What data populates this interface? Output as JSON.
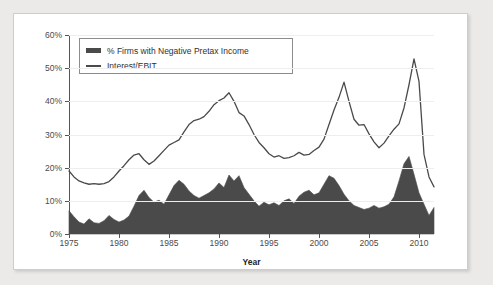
{
  "chart_data": {
    "type": "area",
    "title": "",
    "xlabel": "Year",
    "ylabel": "",
    "xlim": [
      1975,
      2011.5
    ],
    "ylim": [
      0,
      60
    ],
    "grid": true,
    "legend_position": "top-left-inside",
    "y_ticks": [
      "0%",
      "10%",
      "20%",
      "30%",
      "40%",
      "50%",
      "60%"
    ],
    "y_tick_values": [
      0,
      10,
      20,
      30,
      40,
      50,
      60
    ],
    "x_ticks": [
      "1975",
      "1980",
      "1985",
      "1990",
      "1995",
      "2000",
      "2005",
      "2010"
    ],
    "x_tick_values": [
      1975,
      1980,
      1985,
      1990,
      1995,
      2000,
      2005,
      2010
    ],
    "colors": {
      "area": "#4a4a4a",
      "line": "#4a4a4a",
      "grid": "#f0eeec",
      "axis": "#555555"
    },
    "series": [
      {
        "name": "% Firms with Negative Pretax Income",
        "type": "area",
        "x": [
          1975,
          1975.5,
          1976,
          1976.5,
          1977,
          1977.5,
          1978,
          1978.5,
          1979,
          1979.5,
          1980,
          1980.5,
          1981,
          1981.5,
          1982,
          1982.5,
          1983,
          1983.5,
          1984,
          1984.5,
          1985,
          1985.5,
          1986,
          1986.5,
          1987,
          1987.5,
          1988,
          1988.5,
          1989,
          1989.5,
          1990,
          1990.5,
          1991,
          1991.5,
          1992,
          1992.5,
          1993,
          1993.5,
          1994,
          1994.5,
          1995,
          1995.5,
          1996,
          1996.5,
          1997,
          1997.5,
          1998,
          1998.5,
          1999,
          1999.5,
          2000,
          2000.5,
          2001,
          2001.5,
          2002,
          2002.5,
          2003,
          2003.5,
          2004,
          2004.5,
          2005,
          2005.5,
          2006,
          2006.5,
          2007,
          2007.5,
          2008,
          2008.5,
          2009,
          2009.5,
          2010,
          2010.5,
          2011,
          2011.5
        ],
        "values": [
          7.0,
          5.2,
          3.6,
          3.0,
          4.6,
          3.4,
          3.2,
          4.0,
          5.6,
          4.4,
          3.6,
          4.2,
          5.4,
          8.4,
          11.6,
          13.2,
          11.0,
          9.6,
          10.2,
          9.0,
          11.8,
          14.6,
          16.2,
          15.0,
          13.0,
          11.6,
          10.8,
          11.6,
          12.4,
          13.6,
          15.4,
          14.0,
          17.8,
          16.0,
          17.6,
          14.0,
          12.0,
          10.0,
          8.4,
          9.6,
          8.8,
          9.4,
          8.6,
          10.0,
          10.6,
          9.2,
          11.4,
          12.6,
          13.2,
          11.8,
          12.4,
          15.0,
          17.6,
          16.8,
          14.6,
          12.0,
          10.0,
          8.6,
          8.0,
          7.4,
          7.8,
          8.6,
          7.8,
          8.2,
          9.0,
          11.2,
          16.0,
          21.2,
          23.4,
          18.0,
          12.4,
          9.0,
          5.6,
          8.0
        ]
      },
      {
        "name": "Interest/EBIT",
        "type": "line",
        "x": [
          1975,
          1975.5,
          1976,
          1976.5,
          1977,
          1977.5,
          1978,
          1978.5,
          1979,
          1979.5,
          1980,
          1980.5,
          1981,
          1981.5,
          1982,
          1982.5,
          1983,
          1983.5,
          1984,
          1984.5,
          1985,
          1985.5,
          1986,
          1986.5,
          1987,
          1987.5,
          1988,
          1988.5,
          1989,
          1989.5,
          1990,
          1990.5,
          1991,
          1991.5,
          1992,
          1992.5,
          1993,
          1993.5,
          1994,
          1994.5,
          1995,
          1995.5,
          1996,
          1996.5,
          1997,
          1997.5,
          1998,
          1998.5,
          1999,
          1999.5,
          2000,
          2000.5,
          2001,
          2001.5,
          2002,
          2002.5,
          2003,
          2003.5,
          2004,
          2004.5,
          2005,
          2005.5,
          2006,
          2006.5,
          2007,
          2007.5,
          2008,
          2008.5,
          2009,
          2009.5,
          2010,
          2010.5,
          2011,
          2011.5
        ],
        "values": [
          19.0,
          17.2,
          16.0,
          15.4,
          15.0,
          15.2,
          15.0,
          15.2,
          15.8,
          17.2,
          19.0,
          20.6,
          22.4,
          23.8,
          24.2,
          22.4,
          21.0,
          22.0,
          23.6,
          25.2,
          26.8,
          27.6,
          28.4,
          30.8,
          33.0,
          34.2,
          34.6,
          35.4,
          37.0,
          39.0,
          40.2,
          41.0,
          42.6,
          40.0,
          36.6,
          35.6,
          33.0,
          30.0,
          27.6,
          26.0,
          24.2,
          23.2,
          23.6,
          22.8,
          23.0,
          23.6,
          24.6,
          23.8,
          24.0,
          25.2,
          26.2,
          28.6,
          33.0,
          37.4,
          41.2,
          45.8,
          40.0,
          34.6,
          32.8,
          33.0,
          30.2,
          27.8,
          26.0,
          27.4,
          29.6,
          31.6,
          33.2,
          38.0,
          45.0,
          52.8,
          46.0,
          24.0,
          17.2,
          14.2
        ]
      }
    ]
  },
  "legend": {
    "items": [
      {
        "label": "% Firms with Negative Pretax Income",
        "swatch": "area-swatch"
      },
      {
        "label": "Interest/EBIT",
        "swatch": "line-swatch"
      }
    ]
  },
  "axis": {
    "x_title": "Year"
  }
}
